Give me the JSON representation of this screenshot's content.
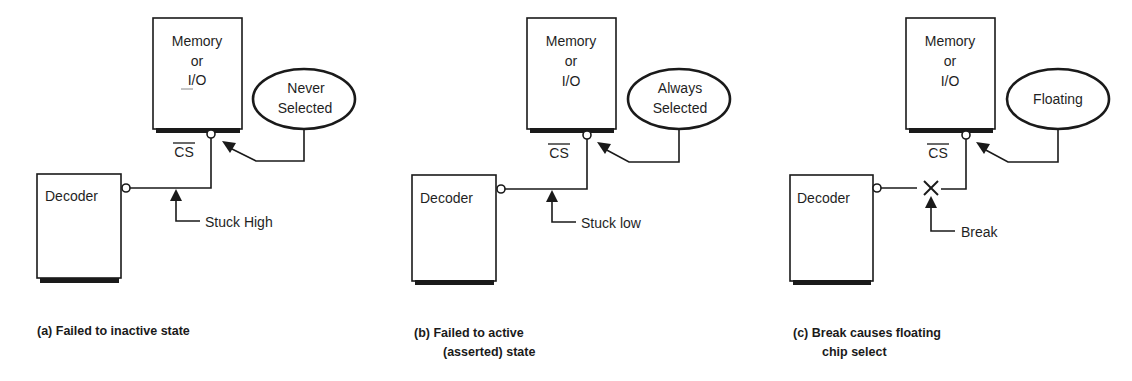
{
  "figure": {
    "panels": [
      {
        "id": "a",
        "memory_label": [
          "Memory",
          "or",
          "I/O"
        ],
        "cs_label": "CS",
        "decoder_label": "Decoder",
        "callout": [
          "Never",
          "Selected"
        ],
        "fault_label": "Stuck High",
        "caption": [
          "(a) Failed to inactive state"
        ]
      },
      {
        "id": "b",
        "memory_label": [
          "Memory",
          "or",
          "I/O"
        ],
        "cs_label": "CS",
        "decoder_label": "Decoder",
        "callout": [
          "Always",
          "Selected"
        ],
        "fault_label": "Stuck low",
        "caption": [
          "(b) Failed to active",
          "(asserted) state"
        ]
      },
      {
        "id": "c",
        "memory_label": [
          "Memory",
          "or",
          "I/O"
        ],
        "cs_label": "CS",
        "decoder_label": "Decoder",
        "callout": [
          "Floating"
        ],
        "fault_label": "Break",
        "caption": [
          "(c) Break causes floating",
          "chip select"
        ]
      }
    ]
  }
}
